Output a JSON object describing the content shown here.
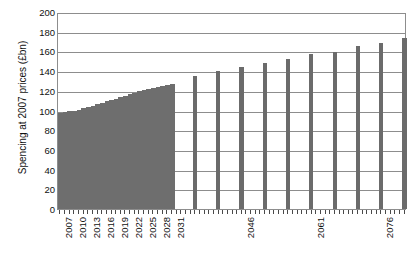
{
  "chart_data": {
    "type": "bar",
    "title": "",
    "subtitle": "",
    "xlabel": "",
    "ylabel": "Spencing at 2007 prices (£bn)",
    "ylim": [
      0,
      200
    ],
    "yticks": [
      0,
      20,
      40,
      60,
      80,
      100,
      120,
      140,
      160,
      180,
      200
    ],
    "ytick_labels": [
      "0",
      "20",
      "40",
      "60",
      "80",
      "100",
      "120",
      "140",
      "160",
      "180",
      "200"
    ],
    "xtick_labels": [
      "2007",
      "2010",
      "2013",
      "2016",
      "2019",
      "2022",
      "2025",
      "2028",
      "2031",
      "2046",
      "2061",
      "2076"
    ],
    "xtick_years": [
      2007,
      2010,
      2013,
      2016,
      2019,
      2022,
      2025,
      2028,
      2031,
      2046,
      2061,
      2076
    ],
    "grid": true,
    "legend": false,
    "legend_position": "none",
    "bar_color": "#6b6b6b",
    "axis_color": "#8d8d8d",
    "series": [
      {
        "name": "Spending at 2007 prices (£bn)",
        "categories": [
          "2007",
          "2008",
          "2009",
          "2010",
          "2011",
          "2012",
          "2013",
          "2014",
          "2015",
          "2016",
          "2017",
          "2018",
          "2019",
          "2020",
          "2021",
          "2022",
          "2023",
          "2024",
          "2025",
          "2026",
          "2027",
          "2028",
          "2029",
          "2030",
          "2031",
          "2036",
          "2041",
          "2046",
          "2051",
          "2056",
          "2061",
          "2066",
          "2071",
          "2076",
          "2081"
        ],
        "values": [
          97,
          98,
          99,
          100,
          101,
          103,
          104,
          105,
          107,
          108,
          110,
          111,
          112,
          114,
          115,
          117,
          118,
          120,
          121,
          122,
          123,
          124,
          125,
          126,
          127,
          135,
          140,
          144,
          148,
          152,
          157,
          159,
          165,
          169,
          174
        ]
      }
    ],
    "annotations": [
      "Contiguous annual bars 2007-2031 form a solid rising block from about 97 to 127.",
      "Sparse bars from 2036 onward are plotted at roughly five-year intervals, rising from about 135 to 174."
    ]
  }
}
